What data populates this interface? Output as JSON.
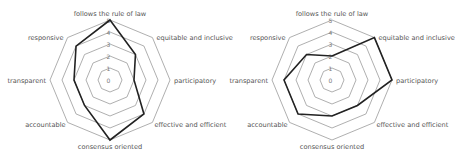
{
  "chart_data": [
    {
      "type": "radar",
      "title": "",
      "categories": [
        "follows the rule of law",
        "equitable and inclusive",
        "participatory",
        "effective and efficient",
        "consensus oriented",
        "accountable",
        "transparent",
        "responsive"
      ],
      "series": [
        {
          "name": "left",
          "values": [
            5,
            3,
            2,
            4,
            5,
            3,
            3,
            4
          ]
        }
      ],
      "ticks": [
        "0",
        "1",
        "2",
        "3",
        "4",
        "5"
      ],
      "rlim": [
        0,
        5
      ],
      "grid": true,
      "legend": false
    },
    {
      "type": "radar",
      "title": "",
      "categories": [
        "follows the rule of law",
        "equitable and inclusive",
        "participatory",
        "effective and efficient",
        "consensus oriented",
        "accountable",
        "transparent",
        "responsive"
      ],
      "series": [
        {
          "name": "right",
          "values": [
            2,
            5,
            5,
            3,
            3,
            4,
            4,
            3
          ]
        }
      ],
      "ticks": [
        "0",
        "1",
        "2",
        "3",
        "4",
        "5"
      ],
      "rlim": [
        0,
        5
      ],
      "grid": true,
      "legend": false
    }
  ],
  "colors": {
    "grid": "#9a9a9a",
    "series": "#222222",
    "label": "#555555"
  }
}
